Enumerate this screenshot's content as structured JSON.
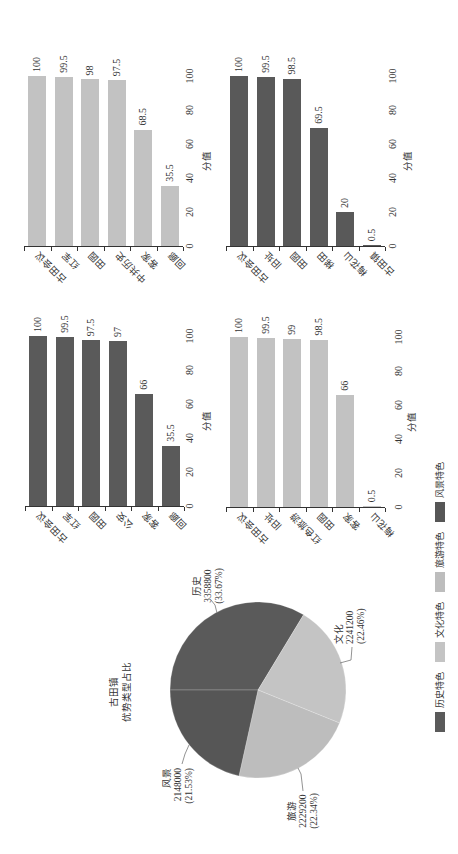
{
  "chart_data": [
    {
      "type": "pie",
      "title": "古田镇 优势类型占比",
      "title_lines": [
        "古田镇",
        "优势类型占比"
      ],
      "labels": [
        "历史",
        "文化",
        "旅游",
        "风景"
      ],
      "values": [
        3358800,
        2241200,
        2229200,
        2148000
      ],
      "percent_labels": [
        "(33.67%)",
        "(22.46%)",
        "(22.34%)",
        "(21.53%)"
      ],
      "colors": [
        "#5a5a5a",
        "#c4c4c4",
        "#bdbdbd",
        "#565656"
      ],
      "legend": {
        "position": "bottom",
        "entries": [
          "历史特色",
          "文化特色",
          "旅游特色",
          "风景特色"
        ]
      }
    },
    {
      "type": "bar",
      "orientation": "horizontal",
      "categories": [
        "古田会议",
        "红军",
        "田园",
        "公安",
        "客家",
        "回廊"
      ],
      "values": [
        100,
        99.5,
        97.5,
        97,
        66,
        35.5
      ],
      "xlabel": "分值",
      "ylabel": "",
      "xlim": [
        0,
        100
      ],
      "xticks": [
        0,
        20,
        40,
        60,
        80,
        100
      ],
      "grid": false,
      "color": "#5a5a5a"
    },
    {
      "type": "bar",
      "orientation": "horizontal",
      "categories": [
        "古田会议",
        "红军",
        "田园",
        "中共历史",
        "客家",
        "回廊"
      ],
      "values": [
        100,
        99.5,
        98,
        97.5,
        68.5,
        35.5
      ],
      "xlabel": "分值",
      "ylabel": "",
      "xlim": [
        0,
        100
      ],
      "xticks": [
        0,
        20,
        40,
        60,
        80,
        100
      ],
      "grid": false,
      "color": "#c2c2c2"
    },
    {
      "type": "bar",
      "orientation": "horizontal",
      "categories": [
        "古田会议",
        "旧址",
        "红色旅游",
        "田园",
        "客家",
        "梅花山"
      ],
      "values": [
        100,
        99.5,
        99,
        98.5,
        66,
        0.5
      ],
      "xlabel": "分值",
      "ylabel": "",
      "xlim": [
        0,
        100
      ],
      "xticks": [
        0,
        20,
        40,
        60,
        80,
        100
      ],
      "grid": false,
      "color": "#c2c2c2"
    },
    {
      "type": "bar",
      "orientation": "horizontal",
      "categories": [
        "古田会议",
        "旧址",
        "田园",
        "梯田",
        "梅花山",
        "古田镇"
      ],
      "values": [
        100,
        99.5,
        98.5,
        69.5,
        20,
        0.5
      ],
      "xlabel": "分值",
      "ylabel": "",
      "xlim": [
        0,
        100
      ],
      "xticks": [
        0,
        20,
        40,
        60,
        80,
        100
      ],
      "grid": false,
      "color": "#595959"
    }
  ]
}
